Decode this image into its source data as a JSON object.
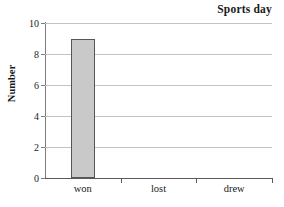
{
  "chart_data": {
    "type": "bar",
    "title": "Sports day",
    "xlabel": "",
    "ylabel": "Number",
    "categories": [
      "won",
      "lost",
      "drew"
    ],
    "values": [
      9,
      0,
      0
    ],
    "ylim": [
      0,
      10
    ],
    "ytick_labels": [
      "0",
      "2",
      "4",
      "6",
      "8",
      "10"
    ],
    "ytick_values": [
      0,
      2,
      4,
      6,
      8,
      10
    ],
    "grid": "horizontal",
    "legend": "none",
    "bar_fill_color": "#c9c9c9",
    "bar_edge_color": "#555555",
    "gridline_color": "#c3c3c3",
    "axis_color": "#5a5a5a",
    "background_color": "#ffffff"
  }
}
